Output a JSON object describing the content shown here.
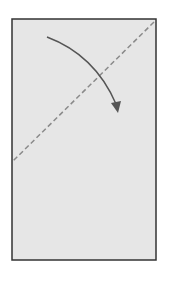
{
  "diagram": {
    "type": "paper-fold-instruction",
    "paper": {
      "x": 12,
      "y": 19,
      "width": 144,
      "height": 241,
      "fill": "#e6e6e6",
      "stroke": "#333333"
    },
    "fold_line": {
      "x1": 154,
      "y1": 22,
      "x2": 13,
      "y2": 161,
      "style": "dashed",
      "color": "#8a8a8a"
    },
    "fold_arrow": {
      "from": [
        47,
        37
      ],
      "to": [
        118,
        112
      ],
      "color": "#555555"
    }
  }
}
